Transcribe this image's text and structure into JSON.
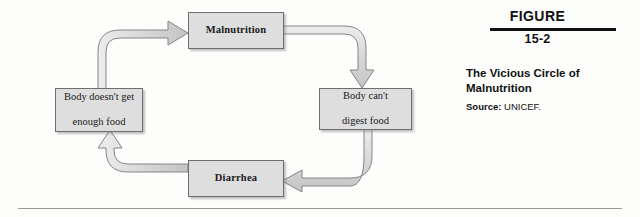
{
  "figure": {
    "label": "FIGURE",
    "number": "15-2",
    "title": "The Vicious Circle of Malnutrition",
    "source_label": "Source:",
    "source_value": "UNICEF."
  },
  "diagram": {
    "type": "cycle-flowchart",
    "nodes": [
      {
        "id": "malnutrition",
        "label": "Malnutrition",
        "bold": true,
        "position": "top"
      },
      {
        "id": "nodigest",
        "label": "Body can't digest food",
        "bold": false,
        "position": "right"
      },
      {
        "id": "diarrhea",
        "label": "Diarrhea",
        "bold": true,
        "position": "bottom"
      },
      {
        "id": "nofood",
        "label": "Body doesn't get enough food",
        "bold": false,
        "position": "left"
      }
    ],
    "node_lines": {
      "malnutrition": [
        "Malnutrition"
      ],
      "nodigest": [
        "Body can't",
        "digest food"
      ],
      "diarrhea": [
        "Diarrhea"
      ],
      "nofood": [
        "Body doesn't get",
        "enough food"
      ]
    },
    "edges": [
      {
        "from": "malnutrition",
        "to": "nodigest",
        "direction": "clockwise"
      },
      {
        "from": "nodigest",
        "to": "diarrhea",
        "direction": "clockwise"
      },
      {
        "from": "diarrhea",
        "to": "nofood",
        "direction": "clockwise"
      },
      {
        "from": "nofood",
        "to": "malnutrition",
        "direction": "clockwise"
      }
    ]
  },
  "colors": {
    "box_fill": "#dedede",
    "box_border": "#6e6e6e",
    "arrow_fill": "#d9d9d9",
    "arrow_border": "#808080",
    "rule": "#111111",
    "page_background": "#fdfdfc"
  }
}
